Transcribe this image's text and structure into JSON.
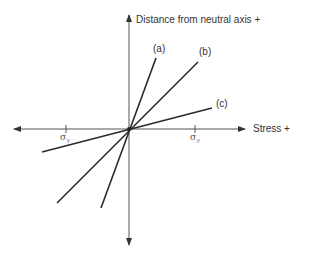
{
  "diagram": {
    "y_axis_label": "Distance from neutral axis +",
    "x_axis_label": "Stress +",
    "tick_labels": [
      {
        "symbol": "σ",
        "sub": "Y",
        "position": "negative"
      },
      {
        "symbol": "σ",
        "sub": "Y",
        "position": "positive"
      }
    ],
    "lines": [
      {
        "label": "(a)"
      },
      {
        "label": "(b)"
      },
      {
        "label": "(c)"
      }
    ],
    "colors": {
      "axis": "#333333",
      "line": "#2a2a2a"
    }
  }
}
